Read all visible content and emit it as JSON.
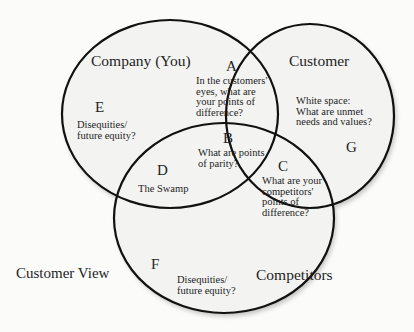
{
  "diagram": {
    "type": "venn",
    "circles": [
      {
        "id": "company",
        "label": "Company (You)"
      },
      {
        "id": "customer",
        "label": "Customer"
      },
      {
        "id": "competitors",
        "label": "Competitors"
      }
    ],
    "regions": {
      "A": {
        "letter": "A",
        "text": "In the customers'\neyes, what are\nyour points of\ndifference?"
      },
      "B": {
        "letter": "B",
        "text": "What are points\nof parity?"
      },
      "C": {
        "letter": "C",
        "text": "What are your\ncompetitors'\npoints of\ndifference?"
      },
      "D": {
        "letter": "D",
        "text": "The Swamp"
      },
      "E": {
        "letter": "E",
        "text": "Disequities/\nfuture equity?"
      },
      "F": {
        "letter": "F",
        "text": "Disequities/\nfuture equity?"
      },
      "G": {
        "letter": "G",
        "text": "White space:\nWhat are unmet\nneeds and values?"
      }
    },
    "side_label": "Customer View",
    "colors": {
      "stroke": "#111111",
      "fill": "#f3f3f1",
      "background": "#fbfbfa",
      "text": "#1e1e1e"
    }
  }
}
